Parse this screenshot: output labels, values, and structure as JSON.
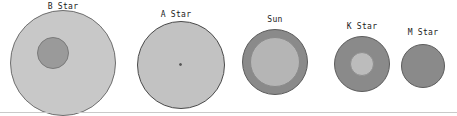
{
  "figure": {
    "width": 457,
    "height": 116,
    "background": "#ffffff",
    "baseline": {
      "y": 112,
      "color": "#c9c9c9",
      "visible": true
    }
  },
  "chart_data": {
    "type": "scatter",
    "title": "",
    "subtitle": "",
    "xlabel": "",
    "ylabel": "",
    "grid": false,
    "legend": "none",
    "categories": [
      "B Star",
      "A Star",
      "Sun",
      "K Star",
      "M Star"
    ],
    "values": [
      53,
      44,
      33,
      28,
      22
    ],
    "series": [
      {
        "name": "disk radius (px)",
        "values": [
          53,
          44,
          33,
          28,
          22
        ]
      },
      {
        "name": "core radius (px)",
        "values": [
          16,
          1.5,
          25,
          12,
          0
        ]
      }
    ],
    "points": [
      {
        "label": "B Star",
        "cx": 63,
        "cy": 63,
        "r": 53,
        "core_r": 16
      },
      {
        "label": "A Star",
        "cx": 181,
        "cy": 65,
        "r": 44,
        "core_r": 1.5
      },
      {
        "label": "Sun",
        "cx": 275,
        "cy": 62,
        "r": 33,
        "core_r": 25
      },
      {
        "label": "K Star",
        "cx": 362,
        "cy": 64,
        "r": 28,
        "core_r": 12
      },
      {
        "label": "M Star",
        "cx": 423,
        "cy": 66,
        "r": 22,
        "core_r": 0
      }
    ]
  },
  "stars": [
    {
      "id": "b-star",
      "label": "B Star",
      "label_left": 41,
      "label_top": 2,
      "label_width": 44,
      "disk": {
        "left": 10,
        "top": 10,
        "size": 106,
        "fill": "#c8c8c8",
        "stroke": "#6e6e6e"
      },
      "core": {
        "left": 37,
        "top": 37,
        "size": 32,
        "fill": "#9a9a9a",
        "stroke": "#7a7a7a",
        "visible": true
      }
    },
    {
      "id": "a-star",
      "label": "A Star",
      "label_left": 154,
      "label_top": 10,
      "label_width": 44,
      "disk": {
        "left": 137,
        "top": 21,
        "size": 88,
        "fill": "#c2c2c2",
        "stroke": "#4a4a4a"
      },
      "core": {
        "left": 42,
        "top": 42,
        "size": 3,
        "fill": "#555555",
        "stroke": "#555555",
        "visible": true
      }
    },
    {
      "id": "sun",
      "label": "Sun",
      "label_left": 260,
      "label_top": 15,
      "label_width": 30,
      "disk": {
        "left": 242,
        "top": 29,
        "size": 66,
        "fill": "#8a8a8a",
        "stroke": "#5c5c5c"
      },
      "core": {
        "left": 8,
        "top": 8,
        "size": 50,
        "fill": "#b5b5b5",
        "stroke": "#8a8a8a",
        "visible": true
      }
    },
    {
      "id": "k-star",
      "label": "K Star",
      "label_left": 340,
      "label_top": 22,
      "label_width": 44,
      "disk": {
        "left": 334,
        "top": 36,
        "size": 56,
        "fill": "#8a8a8a",
        "stroke": "#5c5c5c"
      },
      "core": {
        "left": 16,
        "top": 16,
        "size": 24,
        "fill": "#bcbcbc",
        "stroke": "#8f8f8f",
        "visible": true
      }
    },
    {
      "id": "m-star",
      "label": "M Star",
      "label_left": 401,
      "label_top": 28,
      "label_width": 44,
      "disk": {
        "left": 401,
        "top": 44,
        "size": 44,
        "fill": "#8a8a8a",
        "stroke": "#5c5c5c"
      },
      "core": {
        "left": 0,
        "top": 0,
        "size": 0,
        "fill": "#8a8a8a",
        "stroke": "#8a8a8a",
        "visible": false
      }
    }
  ]
}
